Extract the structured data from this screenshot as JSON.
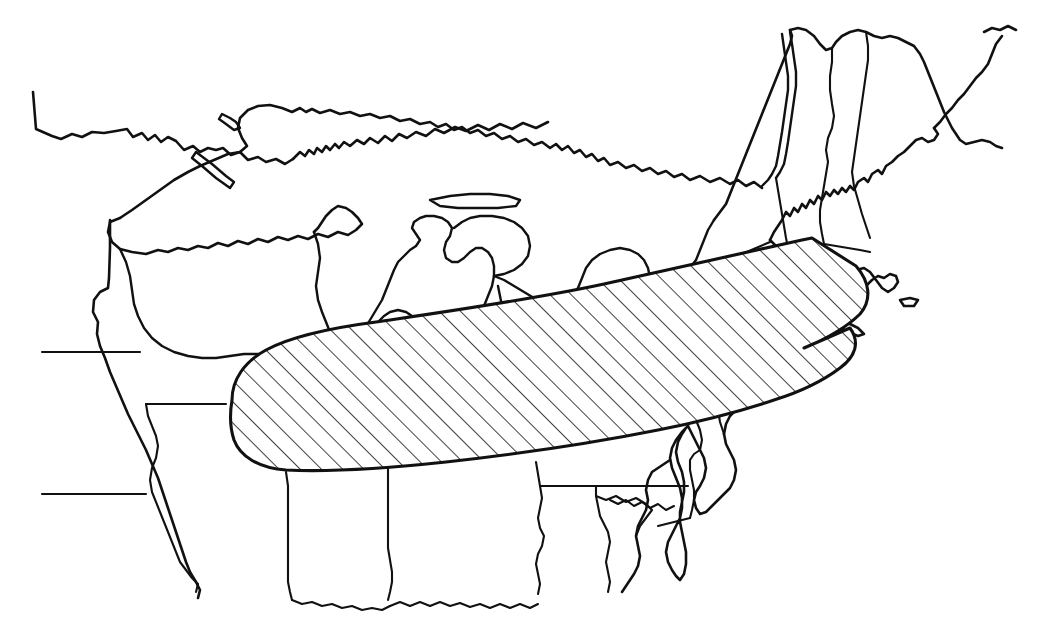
{
  "document": {
    "kind": "distribution-range-map",
    "title": "",
    "caption": "",
    "width": 1040,
    "height": 624
  },
  "style": {
    "background_color": "#ffffff",
    "line_color": "#111111",
    "hatch_color": "#111111",
    "hatch_angle_degrees": 45,
    "hatch_spacing_px": 10.6,
    "hatch_stroke_width_px": 1.6,
    "coast_stroke_width_px": 2.6,
    "border_stroke_width_px": 2.1,
    "range_outline_stroke_width_px": 3.1
  },
  "legend": {
    "present": false,
    "entries": []
  },
  "labels": [],
  "map_content": {
    "region_depicted": "Northeastern and Midwestern United States with Great Lakes",
    "shaded_area": {
      "name": "hatched-range-area",
      "fill_style": "diagonal-hatch",
      "description": "Elongated band extending from the Illinois-Missouri border east-northeast across Indiana, Ohio, Pennsylvania, New York to coastal southern New England"
    },
    "features": [
      "Great Lakes",
      "Lake Superior",
      "Lake Michigan",
      "Lake Huron",
      "Lake Erie",
      "Lake Ontario",
      "Lake Champlain",
      "Chesapeake Bay",
      "Delmarva Peninsula",
      "Cape Cod",
      "Long Island",
      "Atlantic coastline",
      "Canada-United States border",
      "state boundaries"
    ]
  },
  "geometry": {
    "range_polygon": "M 228 420 C 228 396 240 376 262 362 C 290 344 330 334 378 328 C 450 318 540 306 612 290 C 688 272 760 256 812 244 L 856 268 C 872 286 876 304 862 318 C 848 332 826 344 800 354 L 852 330 C 862 344 858 358 842 370 C 826 382 802 394 776 402 C 740 414 700 424 660 432 C 600 444 520 456 448 464 C 392 470 330 474 288 472 C 258 470 238 458 230 442 Z",
    "coastlines": [
      "M 32 94 L 36 130 L 58 140 L 72 134 L 86 136 L 98 130 L 128 130 L 136 136 L 146 132 L 152 140 L 158 136 L 162 144 L 166 138 L 176 140 L 186 150 L 194 146 L 202 152 L 206 148 L 214 150 L 222 148 L 230 154 L 244 152 L 252 160 L 266 162 L 282 164 L 296 162 L 304 156 L 310 160 L 314 154 L 322 156 L 334 148 L 344 152 L 352 144 L 360 150 L 368 146 L 376 150 L 384 144 L 392 146 L 400 140 L 410 142 L 418 134 L 426 136 L 432 130 L 440 132 L 448 124",
      "M 126 216 L 118 222 L 116 236 L 122 246 L 130 252 L 150 254 L 164 248 L 176 250 L 186 242 L 196 244 L 204 236 L 212 238 L 220 230 L 228 232 L 240 224 L 250 226 L 260 218 L 272 220 L 284 212 L 296 214 L 308 206 L 318 208 L 328 200 L 340 202 L 350 196",
      "M 110 218 L 110 250 L 108 286 L 98 294 L 94 310 L 98 322 L 96 340 L 100 352 L 106 366 L 112 384 L 118 398 L 126 414 L 134 428",
      "M 960 32 L 972 34 L 984 30 L 992 36",
      "M 934 64 L 928 78 L 920 86 L 918 98 L 910 106 L 906 118 L 898 124 L 896 136 L 888 142 L 880 152 L 874 160 L 866 164 L 862 172 L 854 176 L 848 184 L 840 186 L 834 194 L 826 196 L 820 204 L 812 206 L 806 214 L 798 216 L 792 224 L 784 228 L 778 236 L 770 240 L 766 248 L 758 252"
    ]
  }
}
